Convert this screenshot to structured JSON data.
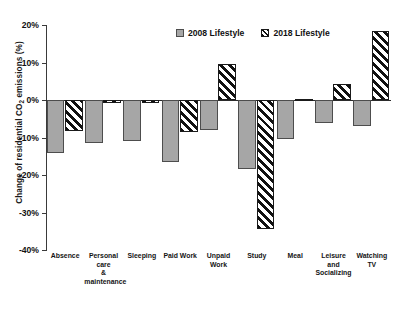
{
  "chart_data": {
    "type": "bar",
    "title": "",
    "xlabel": "",
    "ylabel": "Change of residential CO2 emissions (%)",
    "ylabel_prefix": "Change of residential CO",
    "ylabel_sub": "2",
    "ylabel_suffix": " emissions (%)",
    "ylim": [
      -40,
      20
    ],
    "ytick_values": [
      20,
      10,
      0,
      -10,
      -20,
      -30,
      -40
    ],
    "ytick_labels": [
      "20%",
      "10%",
      "0%",
      "-10%",
      "-20%",
      "-30%",
      "-40%"
    ],
    "grid": false,
    "legend_position": "top-center",
    "categories": [
      "Absence",
      "Personal care & maintenance",
      "Sleeping",
      "Paid Work",
      "Unpaid Work",
      "Study",
      "Meal",
      "Leisure and Socializing",
      "Watching TV"
    ],
    "category_lines": [
      [
        "Absence"
      ],
      [
        "Personal care",
        "&",
        "maintenance"
      ],
      [
        "Sleeping"
      ],
      [
        "Paid Work"
      ],
      [
        "Unpaid Work"
      ],
      [
        "Study"
      ],
      [
        "Meal"
      ],
      [
        "Leisure and",
        "Socializing"
      ],
      [
        "Watching TV"
      ]
    ],
    "series": [
      {
        "name": "2008 Lifestyle",
        "pattern": "solid-gray",
        "color": "#A6A6A6",
        "values": [
          -14.0,
          -11.5,
          -11.0,
          -16.5,
          -8.0,
          -18.5,
          -10.5,
          -6.0,
          -7.0
        ]
      },
      {
        "name": "2018 Lifestyle",
        "pattern": "diagonal-hatch",
        "color": "#FFFFFF",
        "values": [
          -8.2,
          -0.8,
          -0.8,
          -8.5,
          9.5,
          -34.5,
          0.3,
          4.2,
          18.5
        ]
      }
    ]
  },
  "legend": {
    "items": [
      {
        "label": "2008 Lifestyle",
        "swatch": "solid-swatch-icon"
      },
      {
        "label": "2018 Lifestyle",
        "swatch": "hatch-swatch-icon"
      }
    ]
  }
}
